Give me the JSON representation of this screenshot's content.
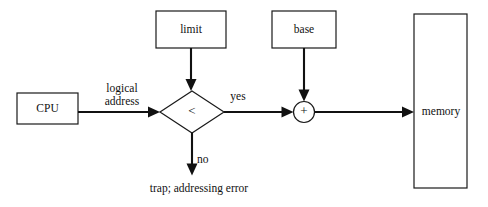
{
  "diagram": {
    "background_color": "#ffffff",
    "stroke_color": "#111111",
    "box_fill": "#ffffff",
    "nodes": {
      "cpu": {
        "label": "CPU",
        "shape": "rectangle"
      },
      "limit": {
        "label": "limit",
        "shape": "rectangle"
      },
      "base": {
        "label": "base",
        "shape": "rectangle"
      },
      "compare": {
        "label": "<",
        "shape": "diamond"
      },
      "adder": {
        "label": "+",
        "shape": "circle"
      },
      "memory": {
        "label": "memory",
        "shape": "rectangle"
      }
    },
    "edge_labels": {
      "logical_line1": "logical",
      "logical_line2": "address",
      "yes": "yes",
      "no": "no",
      "trap": "trap; addressing error"
    }
  }
}
